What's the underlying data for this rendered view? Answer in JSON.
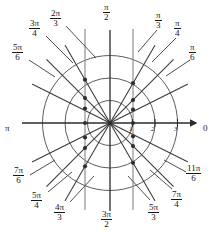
{
  "figure": {
    "type": "polar-grid",
    "title": "",
    "origin": {
      "x": 110,
      "y": 123
    },
    "radial_scale_px_per_unit": 22.5,
    "circle_radii_units": [
      1,
      2,
      3
    ],
    "axis_line_color": "#2b2b2b",
    "grid_color": "#4a4a4a",
    "guide_color": "#8a8a8a",
    "dot_color": "#3a3a3a"
  },
  "axes": {
    "right_label": "0",
    "left_label": "π",
    "radial_ticks": [
      "1",
      "2",
      "3"
    ]
  },
  "angle_labels": [
    {
      "id": "pi-over-2",
      "num": "π",
      "den": "2",
      "angle_deg": 90,
      "kind": "fraction"
    },
    {
      "id": "pi-over-3",
      "num": "π",
      "den": "3",
      "angle_deg": 60,
      "kind": "fraction"
    },
    {
      "id": "pi-over-4",
      "num": "π",
      "den": "4",
      "angle_deg": 45,
      "kind": "fraction"
    },
    {
      "id": "pi-over-6",
      "num": "π",
      "den": "6",
      "angle_deg": 30,
      "kind": "fraction"
    },
    {
      "id": "2pi-over-3",
      "num": "2π",
      "den": "3",
      "angle_deg": 120,
      "kind": "fraction"
    },
    {
      "id": "3pi-over-4",
      "num": "3π",
      "den": "4",
      "angle_deg": 135,
      "kind": "fraction"
    },
    {
      "id": "5pi-over-6",
      "num": "5π",
      "den": "6",
      "angle_deg": 150,
      "kind": "fraction"
    },
    {
      "id": "pi",
      "num": "π",
      "den": "",
      "angle_deg": 180,
      "kind": "plain"
    },
    {
      "id": "7pi-over-6",
      "num": "7π",
      "den": "6",
      "angle_deg": 210,
      "kind": "fraction"
    },
    {
      "id": "5pi-over-4",
      "num": "5π",
      "den": "4",
      "angle_deg": 225,
      "kind": "fraction"
    },
    {
      "id": "4pi-over-3",
      "num": "4π",
      "den": "3",
      "angle_deg": 240,
      "kind": "fraction"
    },
    {
      "id": "3pi-over-2",
      "num": "3π",
      "den": "2",
      "angle_deg": 270,
      "kind": "fraction"
    },
    {
      "id": "5pi-over-3",
      "num": "5π",
      "den": "3",
      "angle_deg": 300,
      "kind": "fraction"
    },
    {
      "id": "7pi-over-4",
      "num": "7π",
      "den": "4",
      "angle_deg": 315,
      "kind": "fraction"
    },
    {
      "id": "11pi-over-6",
      "num": "11π",
      "den": "6",
      "angle_deg": 330,
      "kind": "fraction"
    },
    {
      "id": "zero",
      "num": "0",
      "den": "",
      "angle_deg": 0,
      "kind": "plain"
    }
  ],
  "label_positions": {
    "pi-over-2": {
      "x": 103,
      "y": 3
    },
    "pi-over-3": {
      "x": 155,
      "y": 11
    },
    "pi-over-4": {
      "x": 174,
      "y": 19
    },
    "pi-over-6": {
      "x": 189,
      "y": 43
    },
    "2pi-over-3": {
      "x": 50,
      "y": 9
    },
    "3pi-over-4": {
      "x": 29,
      "y": 19
    },
    "5pi-over-6": {
      "x": 12,
      "y": 43
    },
    "pi": {
      "x": 5,
      "y": 118
    },
    "7pi-over-6": {
      "x": 13,
      "y": 166
    },
    "5pi-over-4": {
      "x": 31,
      "y": 191
    },
    "4pi-over-3": {
      "x": 54,
      "y": 203
    },
    "3pi-over-2": {
      "x": 101,
      "y": 210
    },
    "5pi-over-3": {
      "x": 148,
      "y": 203
    },
    "7pi-over-4": {
      "x": 171,
      "y": 190
    },
    "11pi-over-6": {
      "x": 186,
      "y": 164
    },
    "zero": {
      "x": 203,
      "y": 118
    }
  },
  "guide_lines": [
    {
      "id": "vertical-left",
      "x": 85,
      "y1": 29,
      "y2": 210
    },
    {
      "id": "vertical-right",
      "x": 133,
      "y1": 29,
      "y2": 210
    }
  ],
  "chart_data": {
    "type": "scatter",
    "xlabel": "",
    "ylabel": "",
    "coordinate_system": "polar",
    "theta_ticks_deg": [
      0,
      30,
      45,
      60,
      90,
      120,
      135,
      150,
      180,
      210,
      225,
      240,
      270,
      300,
      315,
      330
    ],
    "theta_tick_labels": [
      "0",
      "π/6",
      "π/4",
      "π/3",
      "π/2",
      "2π/3",
      "3π/4",
      "5π/6",
      "π",
      "7π/6",
      "5π/4",
      "4π/3",
      "3π/2",
      "5π/3",
      "7π/4",
      "11π/6"
    ],
    "r_ticks": [
      1,
      2,
      3
    ],
    "rlim": [
      0,
      3.2
    ],
    "grid": true,
    "legend": false,
    "points": [
      {
        "theta_deg": 30,
        "r": 1.155
      },
      {
        "theta_deg": 45,
        "r": 1.414
      },
      {
        "theta_deg": 60,
        "r": 2.0
      },
      {
        "theta_deg": 120,
        "r": 2.0
      },
      {
        "theta_deg": 135,
        "r": 1.414
      },
      {
        "theta_deg": 150,
        "r": 1.155
      },
      {
        "theta_deg": 210,
        "r": 1.155
      },
      {
        "theta_deg": 225,
        "r": 1.414
      },
      {
        "theta_deg": 240,
        "r": 2.0
      },
      {
        "theta_deg": 300,
        "r": 2.0
      },
      {
        "theta_deg": 315,
        "r": 1.414
      },
      {
        "theta_deg": 330,
        "r": 1.155
      },
      {
        "theta_deg": 15,
        "r": 1.035
      },
      {
        "theta_deg": 165,
        "r": 1.035
      },
      {
        "theta_deg": 195,
        "r": 1.035
      },
      {
        "theta_deg": 345,
        "r": 1.035
      },
      {
        "theta_deg": 75,
        "r": 3.86
      },
      {
        "theta_deg": 105,
        "r": 3.86
      },
      {
        "theta_deg": 255,
        "r": 3.86
      },
      {
        "theta_deg": 285,
        "r": 3.86
      }
    ]
  }
}
